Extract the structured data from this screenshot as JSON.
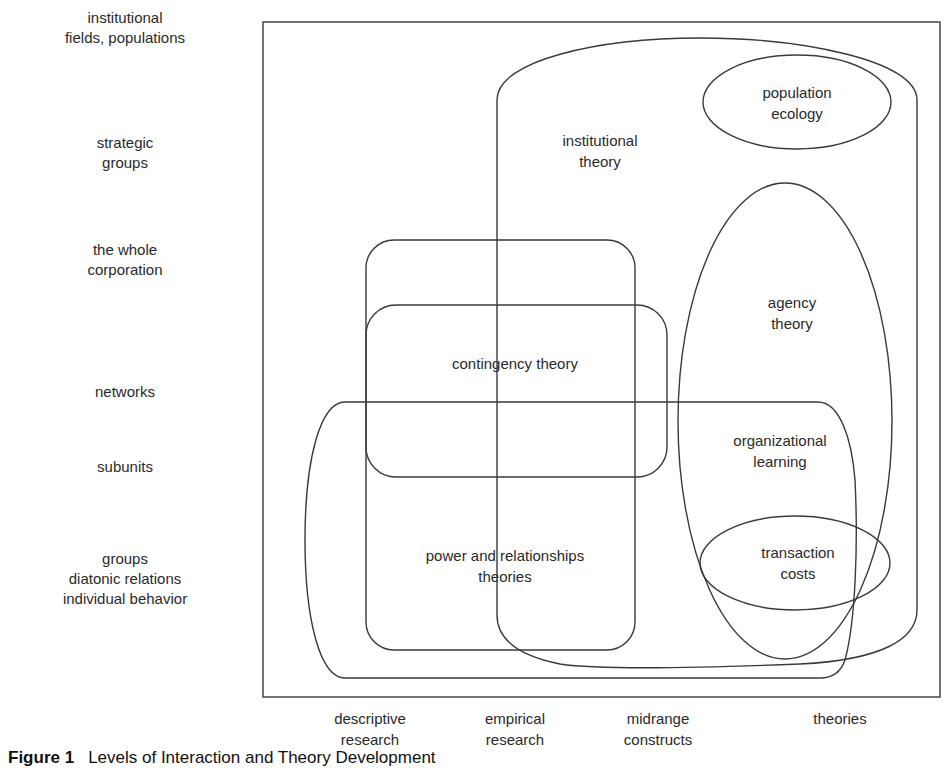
{
  "diagram": {
    "y_axis_levels": [
      "institutional\nfields, populations",
      "strategic\ngroups",
      "the whole\ncorporation",
      "networks",
      "subunits",
      "groups\ndiatonic relations\nindividual behavior"
    ],
    "x_axis_levels": [
      "descriptive\nresearch",
      "empirical\nresearch",
      "midrange\nconstructs",
      "theories"
    ],
    "regions": {
      "institutional_theory": "institutional\ntheory",
      "population_ecology": "population\necology",
      "agency_theory": "agency\ntheory",
      "contingency_theory": "contingency theory",
      "organizational_learning": "organizational\nlearning",
      "transaction_costs": "transaction\ncosts",
      "power_relationships": "power and relationships\ntheories"
    },
    "caption": {
      "figure_label": "Figure 1",
      "title": "Levels of Interaction and Theory Development"
    },
    "colors": {
      "stroke": "#3a3a3a",
      "text": "#2a2a2a",
      "background": "#ffffff"
    }
  }
}
